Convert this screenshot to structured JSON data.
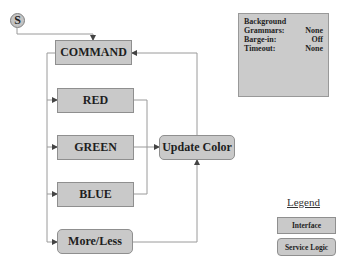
{
  "diagram": {
    "start": {
      "label": "S",
      "icon": "start-circle-icon"
    },
    "nodes": {
      "command": {
        "label": "COMMAND",
        "type": "Interface"
      },
      "red": {
        "label": "RED",
        "type": "Interface"
      },
      "green": {
        "label": "GREEN",
        "type": "Interface"
      },
      "blue": {
        "label": "BLUE",
        "type": "Interface"
      },
      "more_less": {
        "label": "More/Less",
        "type": "Service Logic"
      },
      "update_color": {
        "label": "Update Color",
        "type": "Service Logic"
      }
    },
    "edges": [
      {
        "from": "S",
        "to": "COMMAND"
      },
      {
        "from": "COMMAND",
        "to": "RED"
      },
      {
        "from": "COMMAND",
        "to": "GREEN"
      },
      {
        "from": "COMMAND",
        "to": "BLUE"
      },
      {
        "from": "COMMAND",
        "to": "More/Less"
      },
      {
        "from": "RED",
        "to": "Update Color"
      },
      {
        "from": "GREEN",
        "to": "Update Color"
      },
      {
        "from": "BLUE",
        "to": "Update Color"
      },
      {
        "from": "More/Less",
        "to": "Update Color"
      },
      {
        "from": "Update Color",
        "to": "COMMAND"
      }
    ]
  },
  "info_panel": {
    "title": "Background",
    "rows": [
      {
        "label": "Grammars:",
        "value": "None"
      },
      {
        "label": "Barge-in:",
        "value": "Off"
      },
      {
        "label": "Timeout:",
        "value": "None"
      }
    ]
  },
  "legend": {
    "title": "Legend",
    "items": [
      {
        "label": "Interface",
        "shape": "rectangle"
      },
      {
        "label": "Service Logic",
        "shape": "rounded-rectangle"
      }
    ]
  },
  "colors": {
    "node_fill": "#c9c9c9",
    "node_border": "#8f8f8f",
    "line": "#9a9a9a",
    "text": "#1e1e1e"
  }
}
